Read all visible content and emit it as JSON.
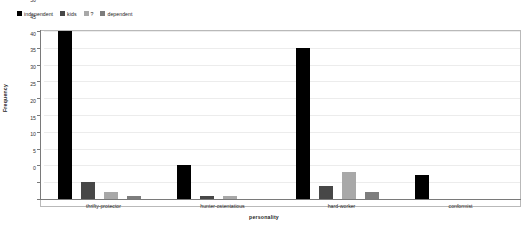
{
  "chart_data": {
    "type": "bar",
    "title": "",
    "xlabel": "personality",
    "ylabel": "Frequency",
    "ylim": [
      0,
      50
    ],
    "yticks": [
      0,
      5,
      10,
      15,
      20,
      25,
      30,
      35,
      40,
      45,
      50
    ],
    "grid": true,
    "legend_position": "top-left",
    "categories": [
      "thrifty-protector",
      "hunter-ostentatious",
      "hard-worker",
      "conformist"
    ],
    "series": [
      {
        "name": "independent",
        "color": "#000000",
        "values": [
          50,
          10,
          45,
          7
        ]
      },
      {
        "name": "kids",
        "color": "#474747",
        "values": [
          5,
          1,
          4,
          0
        ]
      },
      {
        "name": "?",
        "color": "#a8a8a8",
        "values": [
          2,
          1,
          8,
          0
        ]
      },
      {
        "name": "dependent",
        "color": "#7d7d7d",
        "values": [
          1,
          0,
          2,
          0
        ]
      }
    ]
  },
  "legend": {
    "items": [
      {
        "label": "independent",
        "color": "#000000"
      },
      {
        "label": "kids",
        "color": "#474747"
      },
      {
        "label": "?",
        "color": "#a8a8a8"
      },
      {
        "label": "dependent",
        "color": "#7d7d7d"
      }
    ]
  },
  "axes": {
    "y_title": "Frequency",
    "x_title": "personality",
    "y_ticks": [
      "50",
      "45",
      "40",
      "35",
      "30",
      "25",
      "20",
      "15",
      "10",
      "5",
      "0"
    ],
    "x_ticks": [
      "thrifty-protector",
      "hunter-ostentatious",
      "hard-worker",
      "conformist"
    ]
  }
}
